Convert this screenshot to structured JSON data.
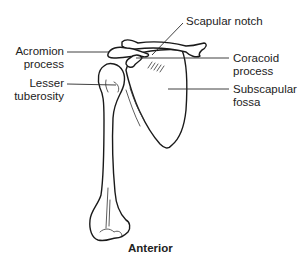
{
  "figure": {
    "view_caption": "Anterior",
    "labels": {
      "scapular_notch": "Scapular notch",
      "acromion_line1": "Acromion",
      "acromion_line2": "process",
      "lesser_line1": "Lesser",
      "lesser_line2": "tuberosity",
      "coracoid_line1": "Coracoid",
      "coracoid_line2": "process",
      "subscapular_line1": "Subscapular",
      "subscapular_line2": "fossa"
    },
    "colors": {
      "line": "#1a1a1a",
      "text": "#222222",
      "background": "#ffffff"
    }
  }
}
